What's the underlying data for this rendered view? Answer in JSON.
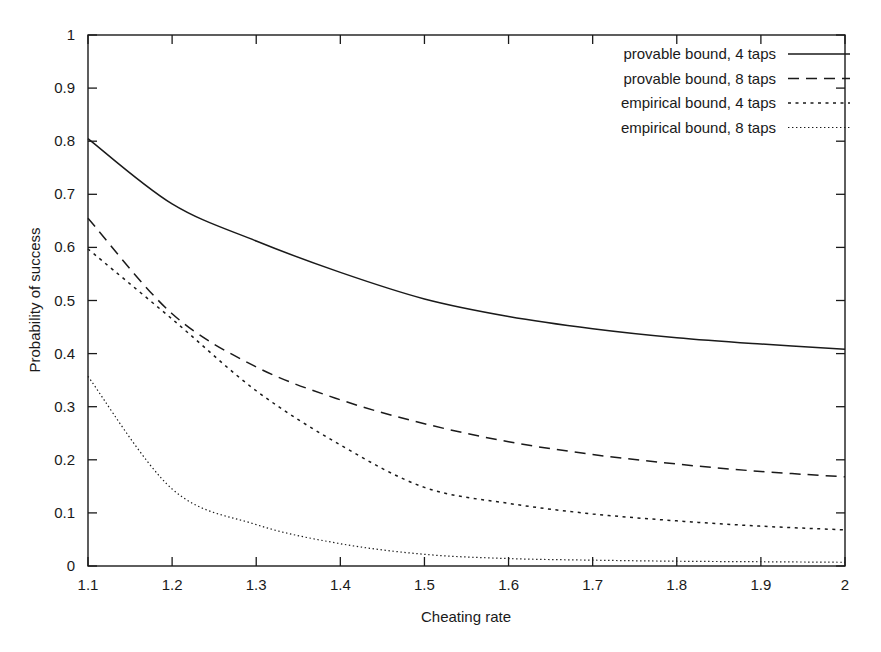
{
  "chart_data": {
    "type": "line",
    "title": "",
    "xlabel": "Cheating rate",
    "ylabel": "Probability of success",
    "xlim": [
      1.1,
      2.0
    ],
    "ylim": [
      0,
      1
    ],
    "grid": false,
    "legend_position": "top-right",
    "xticks": [
      "1.1",
      "1.2",
      "1.3",
      "1.4",
      "1.5",
      "1.6",
      "1.7",
      "1.8",
      "1.9",
      "2"
    ],
    "xtick_values": [
      1.1,
      1.2,
      1.3,
      1.4,
      1.5,
      1.6,
      1.7,
      1.8,
      1.9,
      2.0
    ],
    "yticks": [
      "0",
      "0.1",
      "0.2",
      "0.3",
      "0.4",
      "0.5",
      "0.6",
      "0.7",
      "0.8",
      "0.9",
      "1"
    ],
    "ytick_values": [
      0,
      0.1,
      0.2,
      0.3,
      0.4,
      0.5,
      0.6,
      0.7,
      0.8,
      0.9,
      1.0
    ],
    "x": [
      1.1,
      1.2,
      1.3,
      1.4,
      1.5,
      1.6,
      1.7,
      1.8,
      1.9,
      2.0
    ],
    "series": [
      {
        "name": "provable bound, 4 taps",
        "style": "solid",
        "color": "#1a1a1a",
        "values": [
          0.805,
          0.682,
          0.612,
          0.553,
          0.503,
          0.47,
          0.447,
          0.43,
          0.418,
          0.408
        ]
      },
      {
        "name": "provable bound, 8 taps",
        "style": "dashed",
        "color": "#1a1a1a",
        "values": [
          0.655,
          0.475,
          0.375,
          0.313,
          0.268,
          0.234,
          0.21,
          0.192,
          0.178,
          0.168
        ]
      },
      {
        "name": "empirical bound, 4 taps",
        "style": "dotted",
        "color": "#1a1a1a",
        "values": [
          0.597,
          0.465,
          0.33,
          0.228,
          0.148,
          0.118,
          0.098,
          0.085,
          0.075,
          0.068
        ]
      },
      {
        "name": "empirical bound, 8 taps",
        "style": "fine-dotted",
        "color": "#1a1a1a",
        "values": [
          0.357,
          0.145,
          0.078,
          0.042,
          0.022,
          0.014,
          0.011,
          0.009,
          0.008,
          0.007
        ]
      }
    ]
  },
  "legend": {
    "entries": [
      {
        "label": "provable bound, 4 taps",
        "style": "solid"
      },
      {
        "label": "provable bound, 8 taps",
        "style": "dashed"
      },
      {
        "label": "empirical bound, 4 taps",
        "style": "dotted"
      },
      {
        "label": "empirical bound, 8 taps",
        "style": "fine-dotted"
      }
    ]
  },
  "axes": {
    "x_title": "Cheating rate",
    "y_title": "Probability of success"
  }
}
